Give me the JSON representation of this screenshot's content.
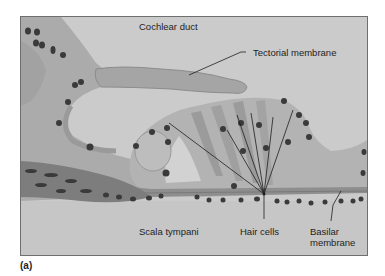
{
  "figure": {
    "panel_label": "(a)",
    "labels": {
      "cochlear_duct": "Cochlear duct",
      "tectorial_membrane": "Tectorial membrane",
      "scala_tympani": "Scala tympani",
      "hair_cells": "Hair cells",
      "basilar_membrane_line1": "Basilar",
      "basilar_membrane_line2": "membrane"
    },
    "colors": {
      "background": "#c9c9c9",
      "tissue_light": "#b4b4b4",
      "tissue_mid": "#9e9e9e",
      "tissue_dark": "#7c7c7c",
      "nucleus": "#3a3a3a",
      "frame": "#6f6f6f",
      "leader_line": "#1e1e1e"
    }
  }
}
